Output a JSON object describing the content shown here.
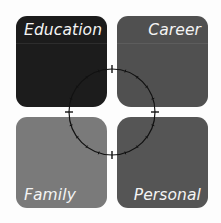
{
  "diagram": {
    "type": "four-quadrant",
    "quadrants": [
      {
        "id": "tl",
        "label": "Education",
        "color": "#1c1c1c"
      },
      {
        "id": "tr",
        "label": "Career",
        "color": "#505050"
      },
      {
        "id": "bl",
        "label": "Family",
        "color": "#7a7a7a"
      },
      {
        "id": "br",
        "label": "Personal",
        "color": "#555555"
      }
    ],
    "center_ring": {
      "stroke": "#111111",
      "major_ticks": 4,
      "minor_ticks_per_quarter": 4
    }
  }
}
